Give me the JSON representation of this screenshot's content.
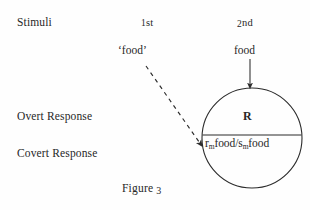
{
  "figure": {
    "caption_word": "Figure",
    "caption_number": "3",
    "background_color": "#fefefe",
    "ink_color": "#272727"
  },
  "row_labels": [
    {
      "id": "stimuli",
      "text": "Stimuli"
    },
    {
      "id": "overt-response",
      "text": "Overt Response"
    },
    {
      "id": "covert-response",
      "text": "Covert Response"
    }
  ],
  "column_headers": [
    {
      "id": "first",
      "ordinal_digit": "1",
      "ordinal_suffix": "st"
    },
    {
      "id": "second",
      "ordinal_digit": "2",
      "ordinal_suffix": "nd"
    }
  ],
  "stimuli": {
    "first_label": "‘food’",
    "second_label": "food"
  },
  "response_circle": {
    "overt_label": "R",
    "covert_formula_prefix": "r",
    "covert_formula_sub1": "m",
    "covert_formula_mid": "food/s",
    "covert_formula_sub2": "m",
    "covert_formula_suffix": "food",
    "center_x": 252,
    "center_y": 138,
    "radius": 50,
    "diameter_line_y": 135,
    "stroke_color": "#2b2b2b",
    "stroke_width": 1.1
  },
  "arrows": {
    "solid_vertical": {
      "name": "food-to-response-arrow",
      "x": 250,
      "y_start": 59,
      "y_end": 88,
      "style": "solid",
      "stroke_color": "#2b2b2b"
    },
    "dashed_diagonal": {
      "name": "spoken-food-to-covert-response-arrow",
      "x_start": 146,
      "y_start": 66,
      "x_end": 203,
      "y_end": 147,
      "style": "dashed",
      "dash_pattern": "4 4",
      "stroke_color": "#2b2b2b"
    }
  }
}
